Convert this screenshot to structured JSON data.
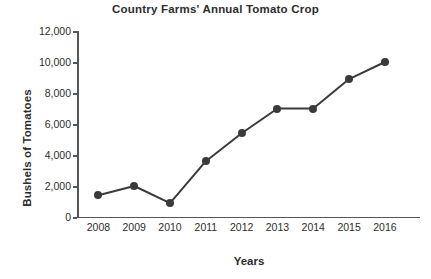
{
  "chart_data": {
    "type": "line",
    "title": "Country Farms' Annual Tomato Crop",
    "xlabel": "Years",
    "ylabel": "Bushels of Tomatoes",
    "categories": [
      "2008",
      "2009",
      "2010",
      "2011",
      "2012",
      "2013",
      "2014",
      "2015",
      "2016"
    ],
    "values": [
      1400,
      2000,
      900,
      3600,
      5400,
      7000,
      7000,
      8900,
      10000
    ],
    "series": [
      {
        "name": "Bushels of Tomatoes",
        "values": [
          1400,
          2000,
          900,
          3600,
          5400,
          7000,
          7000,
          8900,
          10000
        ]
      }
    ],
    "ylim": [
      0,
      12000
    ],
    "yticks": [
      0,
      2000,
      4000,
      6000,
      8000,
      10000,
      12000
    ],
    "ytick_labels": [
      "0",
      "2,000",
      "4,000",
      "6,000",
      "8,000",
      "10,000",
      "12,000"
    ],
    "grid": false,
    "legend": "none",
    "marker": "circle",
    "line_color": "#3a3a3a",
    "marker_color": "#3a3a3a",
    "axis_color": "#555555",
    "text_color": "#2d2d2d",
    "background": "#ffffff"
  }
}
